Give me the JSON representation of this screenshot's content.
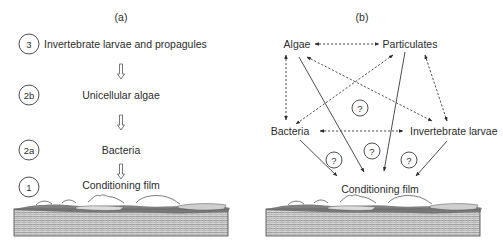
{
  "panel_a": {
    "label": "(a)",
    "stages": [
      {
        "number": "3",
        "text": "Invertebrate larvae and propagules"
      },
      {
        "number": "2b",
        "text": "Unicellular algae"
      },
      {
        "number": "2a",
        "text": "Bacteria"
      },
      {
        "number": "1",
        "text": "Conditioning film"
      }
    ],
    "arrow_icon": "hollow-down-arrow"
  },
  "panel_b": {
    "label": "(b)",
    "nodes": {
      "algae": "Algae",
      "particulates": "Particulates",
      "bacteria": "Bacteria",
      "invertebrate": "Invertebrate larvae",
      "film": "Conditioning film"
    },
    "unknown_marker": "?",
    "dotted_links": [
      [
        "algae",
        "particulates"
      ],
      [
        "algae",
        "bacteria"
      ],
      [
        "particulates",
        "bacteria"
      ],
      [
        "algae",
        "invertebrate"
      ],
      [
        "particulates",
        "invertebrate"
      ],
      [
        "bacteria",
        "invertebrate"
      ]
    ],
    "solid_links": [
      [
        "algae",
        "film"
      ],
      [
        "particulates",
        "film"
      ],
      [
        "bacteria",
        "film"
      ],
      [
        "invertebrate",
        "film"
      ]
    ]
  },
  "substrate_icon": "hatched-substrate-with-biofilm"
}
